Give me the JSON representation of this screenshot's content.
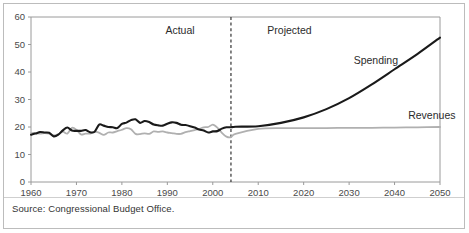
{
  "figure": {
    "source_note": "Source: Congressional Budget Office.",
    "period_labels": {
      "actual": "Actual",
      "projected": "Projected"
    }
  },
  "chart_data": {
    "type": "line",
    "title": "",
    "subtitle": "",
    "xlabel": "",
    "ylabel": "",
    "xlim": [
      1960,
      2050
    ],
    "ylim": [
      0,
      60
    ],
    "grid": false,
    "legend_position": "inline-annotation",
    "x_ticks": [
      1960,
      1970,
      1980,
      1990,
      2000,
      2010,
      2020,
      2030,
      2040,
      2050
    ],
    "y_ticks": [
      0,
      10,
      20,
      30,
      40,
      50,
      60
    ],
    "x_tick_labels": [
      "1960",
      "1970",
      "1980",
      "1990",
      "2000",
      "2010",
      "2020",
      "2030",
      "2040",
      "2050"
    ],
    "y_tick_labels": [
      "0",
      "10",
      "20",
      "30",
      "40",
      "50",
      "60"
    ],
    "annotations": [
      {
        "text": "Actual",
        "x": 1996,
        "y": 54
      },
      {
        "text": "Projected",
        "x": 2012,
        "y": 54
      },
      {
        "text": "Spending",
        "x": 2031,
        "y": 43
      },
      {
        "text": "Revenues",
        "x": 2043,
        "y": 23
      }
    ],
    "divider": {
      "type": "vertical-dashed",
      "x": 2004,
      "label_left": "Actual",
      "label_right": "Projected"
    },
    "colors": {
      "spending": "#1a1a1a",
      "revenues": "#b0b0b0",
      "axis": "#9a9a9a",
      "divider": "#333333",
      "frame": "#bcbcbc"
    },
    "series": [
      {
        "name": "Spending",
        "color": "#1a1a1a",
        "x": [
          1960,
          1961,
          1962,
          1963,
          1964,
          1965,
          1966,
          1967,
          1968,
          1969,
          1970,
          1971,
          1972,
          1973,
          1974,
          1975,
          1976,
          1977,
          1978,
          1979,
          1980,
          1981,
          1982,
          1983,
          1984,
          1985,
          1986,
          1987,
          1988,
          1989,
          1990,
          1991,
          1992,
          1993,
          1994,
          1995,
          1996,
          1997,
          1998,
          1999,
          2000,
          2001,
          2002,
          2003,
          2004,
          2005,
          2010,
          2015,
          2020,
          2025,
          2030,
          2035,
          2040,
          2045,
          2050
        ],
        "values": [
          17.2,
          17.6,
          18.2,
          18.0,
          17.9,
          16.6,
          17.2,
          18.8,
          19.8,
          18.7,
          18.6,
          18.6,
          18.9,
          18.1,
          18.3,
          20.9,
          20.5,
          20.0,
          19.9,
          19.6,
          21.1,
          21.6,
          22.5,
          22.8,
          21.5,
          22.2,
          21.8,
          20.9,
          20.6,
          20.5,
          21.2,
          21.7,
          21.5,
          20.8,
          20.7,
          20.3,
          19.8,
          19.1,
          18.7,
          18.0,
          18.4,
          18.5,
          19.4,
          19.9,
          19.9,
          20.1,
          20.3,
          21.5,
          23.5,
          26.5,
          30.5,
          35.5,
          41.0,
          46.5,
          52.5
        ],
        "style": "solid",
        "width": 2.1
      },
      {
        "name": "Revenues",
        "color": "#b0b0b0",
        "x": [
          1960,
          1961,
          1962,
          1963,
          1964,
          1965,
          1966,
          1967,
          1968,
          1969,
          1970,
          1971,
          1972,
          1973,
          1974,
          1975,
          1976,
          1977,
          1978,
          1979,
          1980,
          1981,
          1982,
          1983,
          1984,
          1985,
          1986,
          1987,
          1988,
          1989,
          1990,
          1991,
          1992,
          1993,
          1994,
          1995,
          1996,
          1997,
          1998,
          1999,
          2000,
          2001,
          2002,
          2003,
          2004,
          2005,
          2010,
          2015,
          2020,
          2025,
          2030,
          2035,
          2040,
          2045,
          2050
        ],
        "values": [
          17.8,
          17.8,
          17.6,
          17.8,
          17.6,
          17.0,
          17.3,
          18.3,
          17.6,
          19.7,
          19.0,
          17.3,
          17.6,
          17.6,
          18.3,
          17.9,
          17.1,
          18.0,
          18.0,
          18.5,
          19.0,
          19.6,
          19.2,
          17.5,
          17.4,
          17.7,
          17.5,
          18.4,
          18.2,
          18.4,
          18.0,
          17.8,
          17.5,
          17.5,
          18.1,
          18.5,
          18.9,
          19.3,
          19.9,
          20.0,
          20.9,
          19.8,
          17.9,
          16.5,
          16.3,
          17.5,
          19.3,
          19.6,
          19.6,
          19.6,
          19.7,
          19.7,
          19.8,
          19.9,
          20.0
        ],
        "style": "solid",
        "width": 1.8
      }
    ]
  }
}
